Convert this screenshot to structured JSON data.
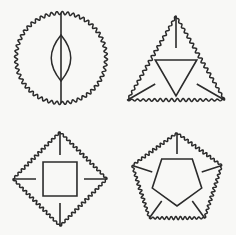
{
  "canvas": {
    "width": 236,
    "height": 235,
    "background_color": "#f8f8f6",
    "stroke_color": "#2b2b2b",
    "stroke_width": 1.5,
    "description": "Four line-drawn geometric figures arranged in a two by two grid, each with a scalloped wavy outer border and straight inner construction lines"
  },
  "figures": [
    {
      "id": "figure-circle-lens",
      "name": "wavy-circle-with-lens",
      "grid_position": "top-left",
      "outer_shape": "circle",
      "outer_edge_style": "wavy",
      "center": {
        "x": 61,
        "y": 58
      },
      "radius": 45,
      "wave": {
        "amplitude": 1.6,
        "count": 52
      },
      "inner_elements": [
        {
          "type": "vertical-line",
          "x": 61,
          "y1": 13,
          "y2": 103
        },
        {
          "type": "lens",
          "cx": 61,
          "top_y": 35,
          "bottom_y": 81,
          "half_width": 13
        }
      ]
    },
    {
      "id": "figure-triangle",
      "name": "wavy-triangle-with-inner-triangle",
      "grid_position": "top-right",
      "outer_shape": "triangle",
      "outer_edge_style": "wavy",
      "sides": 3,
      "center": {
        "x": 176,
        "y": 72
      },
      "radius": 56,
      "rotation_deg": -90,
      "wave": {
        "amplitude": 1.6,
        "per_side": 17
      },
      "inner_elements": [
        {
          "type": "inner-polygon",
          "sides": 3,
          "radius": 24
        },
        {
          "type": "spokes",
          "count": 3
        }
      ]
    },
    {
      "id": "figure-diamond",
      "name": "wavy-diamond-with-inner-diamond",
      "grid_position": "bottom-left",
      "outer_shape": "square-rotated",
      "outer_edge_style": "wavy",
      "sides": 4,
      "center": {
        "x": 60,
        "y": 179
      },
      "radius": 47,
      "rotation_deg": -90,
      "wave": {
        "amplitude": 1.6,
        "per_side": 14
      },
      "inner_elements": [
        {
          "type": "inner-polygon",
          "sides": 4,
          "radius": 24
        },
        {
          "type": "spokes",
          "count": 4
        }
      ]
    },
    {
      "id": "figure-pentagon",
      "name": "wavy-pentagon-with-inner-pentagon",
      "grid_position": "bottom-right",
      "outer_shape": "pentagon",
      "outer_edge_style": "wavy",
      "sides": 5,
      "center": {
        "x": 177,
        "y": 180
      },
      "radius": 47,
      "rotation_deg": -90,
      "wave": {
        "amplitude": 1.6,
        "per_side": 12
      },
      "inner_elements": [
        {
          "type": "inner-polygon",
          "sides": 5,
          "radius": 26
        },
        {
          "type": "spokes",
          "count": 5
        }
      ]
    }
  ]
}
